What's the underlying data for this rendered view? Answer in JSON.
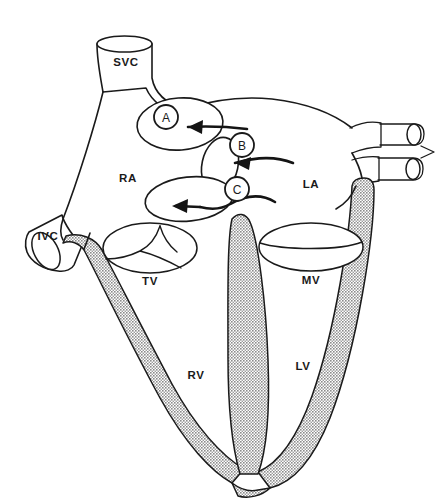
{
  "figure": {
    "background_color": "#ffffff",
    "line_color": "#1a1a1a",
    "myocardium_fill": "#a8a8a8"
  },
  "chambers": [
    {
      "id": "ra",
      "label": "RA",
      "name": "right-atrium",
      "x": 128,
      "y": 178
    },
    {
      "id": "la",
      "label": "LA",
      "name": "left-atrium",
      "x": 311,
      "y": 184
    },
    {
      "id": "rv",
      "label": "RV",
      "name": "right-ventricle",
      "x": 196,
      "y": 375
    },
    {
      "id": "lv",
      "label": "LV",
      "name": "left-ventricle",
      "x": 303,
      "y": 366
    }
  ],
  "vessels": [
    {
      "id": "svc",
      "label": "SVC",
      "name": "superior-vena-cava",
      "x": 126,
      "y": 62
    },
    {
      "id": "ivc",
      "label": "IVC",
      "name": "inferior-vena-cava",
      "x": 48,
      "y": 242
    },
    {
      "id": "pv_upper",
      "label": "",
      "name": "pulmonary-vein-upper"
    },
    {
      "id": "pv_lower",
      "label": "",
      "name": "pulmonary-vein-lower"
    }
  ],
  "valves": [
    {
      "id": "tv",
      "label": "TV",
      "name": "tricuspid-valve",
      "leaflets": 3,
      "x": 150,
      "y": 281
    },
    {
      "id": "mv",
      "label": "MV",
      "name": "mitral-valve",
      "leaflets": 2,
      "x": 311,
      "y": 280
    }
  ],
  "callouts": [
    {
      "id": "a",
      "label": "A",
      "name": "defect-callout-a",
      "cx": 166,
      "cy": 117,
      "r": 12
    },
    {
      "id": "b",
      "label": "B",
      "name": "defect-callout-b",
      "cx": 242,
      "cy": 145,
      "r": 12
    },
    {
      "id": "c",
      "label": "C",
      "name": "defect-callout-c",
      "cx": 237,
      "cy": 189,
      "r": 12
    }
  ],
  "flow_arrows": [
    {
      "id": "arrow_a",
      "name": "shunt-flow-arrow-a",
      "direction": "right-to-left"
    },
    {
      "id": "arrow_b",
      "name": "shunt-flow-arrow-b",
      "direction": "right-to-left"
    },
    {
      "id": "arrow_c",
      "name": "shunt-flow-arrow-c",
      "direction": "right-to-left"
    }
  ],
  "defect_openings": [
    {
      "id": "defect_a",
      "name": "septal-defect-opening-a"
    },
    {
      "id": "defect_b",
      "name": "septal-defect-opening-b"
    },
    {
      "id": "defect_c",
      "name": "septal-defect-opening-c"
    }
  ]
}
